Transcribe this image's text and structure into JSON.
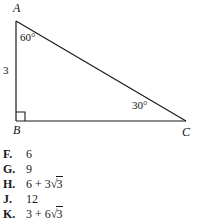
{
  "figure": {
    "type": "right-triangle",
    "vertices": {
      "a": "A",
      "b": "B",
      "c": "C"
    },
    "angles": {
      "at_a": "60°",
      "at_c": "30°",
      "at_b": "right angle"
    },
    "sides": {
      "ab_label": "3"
    },
    "geometry": {
      "ax": 16,
      "ay": 21,
      "bx": 16,
      "by": 121,
      "cx": 186,
      "cy": 121,
      "right_angle_marker_size": 9
    },
    "stroke_color": "#1a1a1a"
  },
  "choices": [
    {
      "key": "F.",
      "value": "6",
      "has_radical": false,
      "prefix": "",
      "radicand": ""
    },
    {
      "key": "G.",
      "value": "9",
      "has_radical": false,
      "prefix": "",
      "radicand": ""
    },
    {
      "key": "H.",
      "value": "6 + 3√3",
      "has_radical": true,
      "prefix": "6 + 3",
      "radicand": "3"
    },
    {
      "key": "J.",
      "value": "12",
      "has_radical": false,
      "prefix": "",
      "radicand": ""
    },
    {
      "key": "K.",
      "value": "3 + 6√3",
      "has_radical": true,
      "prefix": "3 + 6",
      "radicand": "3"
    }
  ]
}
